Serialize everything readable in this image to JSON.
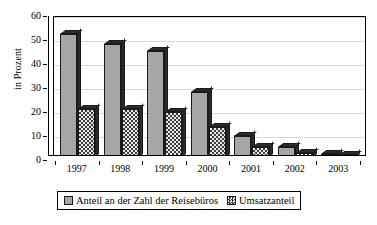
{
  "chart_data": {
    "type": "bar",
    "title": "",
    "subtitle": "",
    "xlabel": "",
    "ylabel": "in Prozent",
    "ylim": [
      0,
      60
    ],
    "ytick_step": 10,
    "yticks": [
      0,
      10,
      20,
      30,
      40,
      50,
      60
    ],
    "grid": true,
    "legend_position": "bottom",
    "categories": [
      "1997",
      "1998",
      "1999",
      "2000",
      "2001",
      "2002",
      "2003"
    ],
    "series": [
      {
        "name": "Anteil an der Zahl der Reisebüros",
        "pattern": "solid-gray",
        "color": "#a6a6a6",
        "values": [
          52,
          48,
          45,
          28,
          9.5,
          5,
          2
        ]
      },
      {
        "name": "Umsatzanteil",
        "pattern": "checker-hatch",
        "color": "#3d3d3d",
        "values": [
          21,
          21,
          19.5,
          13.5,
          5,
          2.5,
          1.5
        ]
      }
    ],
    "annotations": []
  },
  "colors": {
    "background": "#ffffff",
    "axis": "#000000",
    "gridline": "#d9d9d9",
    "series1": "#a6a6a6",
    "series2": "#3d3d3d"
  }
}
